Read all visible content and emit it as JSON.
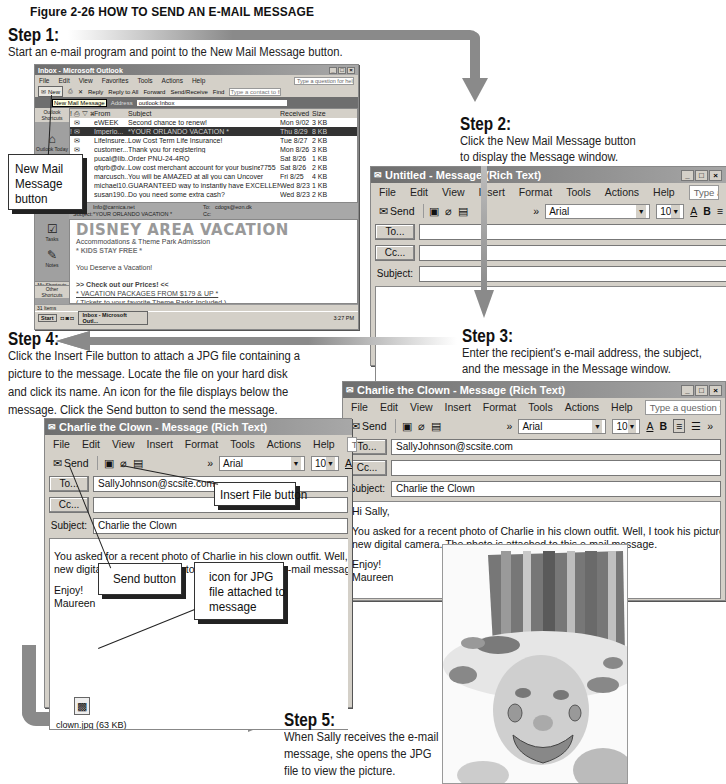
{
  "figure": {
    "title": "Figure 2-26 HOW TO SEND AN E-MAIL MESSAGE"
  },
  "steps": [
    {
      "heading": "Step 1:",
      "text": "Start an e-mail program and point to the New Mail Message button."
    },
    {
      "heading": "Step 2:",
      "lines": [
        "Click the New Mail Message button",
        "to display the Message window."
      ]
    },
    {
      "heading": "Step 3:",
      "lines": [
        "Enter the recipient's e-mail address, the subject,",
        "and the message in the Message window."
      ]
    },
    {
      "heading": "Step 4:",
      "lines": [
        "Click the Insert File button to attach a JPG file containing a",
        "picture to the message. Locate the file on your hard disk",
        "and click its name. An icon for the file displays below the",
        "message. Click the Send button to send the message."
      ]
    },
    {
      "heading": "Step 5:",
      "lines": [
        "When Sally receives the e-mail",
        "message, she opens the JPG",
        "file to view the picture."
      ]
    }
  ],
  "callouts": {
    "new_mail": [
      "New Mail",
      "Message",
      "button"
    ],
    "insert_file": "Insert File button",
    "send": "Send button",
    "jpg_icon": [
      "icon for JPG",
      "file attached to",
      "message"
    ]
  },
  "outlook": {
    "title": "Inbox - Microsoft Outlook",
    "menu": [
      "File",
      "Edit",
      "View",
      "Favorites",
      "Tools",
      "Actions",
      "Help"
    ],
    "help_placeholder": "Type a question for help",
    "toolbar": [
      "New",
      "Reply",
      "Reply to All",
      "Forward",
      "Send/Receive",
      "Find"
    ],
    "contact_placeholder": "Type a contact to find",
    "tooltip": "New Mail Message",
    "address_label": "Address",
    "address_value": "outlook:Inbox",
    "shortcuts": [
      "Outlook Shortcuts",
      "Outlook Today",
      "Tasks",
      "Notes",
      "My Shortcuts",
      "Other Shortcuts"
    ],
    "columns": [
      "From",
      "Subject",
      "Received",
      "Size"
    ],
    "messages": [
      {
        "from": "eWEEK",
        "subject": "Second chance to renew!",
        "received": "Mon 9/02",
        "size": "3 KB"
      },
      {
        "from": "Imperio...",
        "subject": "*YOUR ORLANDO VACATION *",
        "received": "Thu 8/29",
        "size": "8 KB",
        "selected": true
      },
      {
        "from": "LifeInsure...",
        "subject": "Low Cost Term Life Insurance!",
        "received": "Tue 8/27",
        "size": "2 KB"
      },
      {
        "from": "customer...",
        "subject": "Thank you for registering",
        "received": "Mon 8/26",
        "size": "3 KB"
      },
      {
        "from": "pucal@lib...",
        "subject": "Order PNU-24-4RQ",
        "received": "Sat 8/26",
        "size": "1 KB"
      },
      {
        "from": "gfgrb@dv...",
        "subject": "Low cost merchant account for your business",
        "extra": "7755",
        "received": "Sat 8/26",
        "size": "2 KB"
      },
      {
        "from": "marcusch...",
        "subject": "You will be AMAZED at all you can Uncover",
        "received": "Fri 8/25",
        "size": "4 KB"
      },
      {
        "from": "michael10...",
        "subject": "GUARANTEED way to instantly have EXCELLENT CREDIT!!",
        "received": "Wed 8/23",
        "size": "1 KB"
      },
      {
        "from": "susan190...",
        "subject": "Do you need some extra cash?",
        "received": "Wed 8/23",
        "size": "2 KB"
      }
    ],
    "preview_header": {
      "from_label": "From:",
      "from": "Info@carnica.net",
      "to_label": "To:",
      "to": "cdogs@eon.dk",
      "subject_label": "Subject:",
      "subject": "*YOUR ORLANDO VACATION *",
      "cc_label": "Cc:"
    },
    "preview": {
      "heading": "DISNEY AREA VACATION",
      "line1": "Accommodations & Theme Park Admission",
      "line2": "* KIDS STAY FREE *",
      "line3": "You Deserve a Vacation!",
      "line4": ">> Check out our Prices! <<",
      "line5": "* VACATION PACKAGES FROM $179 & UP *",
      "line6": "( Tickets to your favorite Theme Parks Included )"
    },
    "status": "31 Items",
    "taskbar": {
      "start": "Start",
      "task": "Inbox - Microsoft Outl...",
      "time": "3:27 PM"
    }
  },
  "untitled_window": {
    "title": "Untitled - Message (Rich Text)",
    "menu": [
      "File",
      "Edit",
      "View",
      "Insert",
      "Format",
      "Tools",
      "Actions",
      "Help"
    ],
    "help_placeholder": "Type a question for help",
    "send": "Send",
    "font": "Arial",
    "size": "10",
    "to_label": "To...",
    "cc_label": "Cc...",
    "subject_label": "Subject:"
  },
  "charlie_window_right": {
    "title": "Charlie the Clown - Message (Rich Text)",
    "menu": [
      "File",
      "Edit",
      "View",
      "Insert",
      "Format",
      "Tools",
      "Actions",
      "Help"
    ],
    "help_placeholder": "Type a question for help",
    "send": "Send",
    "font": "Arial",
    "size": "10",
    "to_label": "To...",
    "to_value": "SallyJohnson@scsite.com",
    "cc_label": "Cc...",
    "subject_label": "Subject:",
    "subject_value": "Charlie the Clown",
    "body": {
      "greeting": "Hi Sally,",
      "para1": "You asked for a recent photo of Charlie in his clown outfit. Well, I took his picture with our",
      "para2": "new digital camera. The photo is attached to this e-mail message.",
      "sign1": "Enjoy!",
      "sign2": "Maureen"
    }
  },
  "charlie_window_left": {
    "title": "Charlie the Clown - Message (Rich Text)",
    "menu": [
      "File",
      "Edit",
      "View",
      "Insert",
      "Format",
      "Tools",
      "Actions",
      "Help"
    ],
    "help_placeholder": "Type a que",
    "send": "Send",
    "font": "Arial",
    "size": "10",
    "to_label": "To...",
    "to_value": "SallyJohnson@scsite.com",
    "cc_label": "Cc...",
    "subject_label": "Subject:",
    "subject_value": "Charlie the Clown",
    "body": {
      "para1": "You asked for a recent photo of Charlie in his clown outfit. Well, I took his pict",
      "para2": "new digital camera. The photo is attached to this e-mail message.",
      "sign1": "Enjoy!",
      "sign2": "Maureen"
    },
    "attachment": "clown.jpg (63 KB)"
  },
  "photo": {
    "alt": "clown photo"
  },
  "colors": {
    "arrow": "#8a8a8a",
    "window_chrome": "#d4d0c8",
    "titlebar": "#7a7a7a"
  }
}
